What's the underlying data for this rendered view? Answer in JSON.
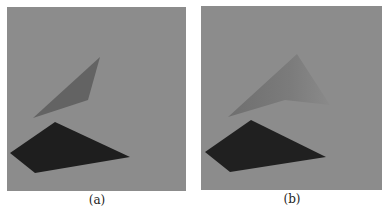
{
  "figure": {
    "panels": [
      {
        "id": "a",
        "caption": "(a)",
        "background": "#8c8c8c",
        "bbox": {
          "x": 7,
          "y": 7,
          "w": 179,
          "h": 184
        },
        "occluder": {
          "color": "#636363",
          "points": "100,57 88,100 33,118"
        },
        "shadow": {
          "color": "#1e1e1e",
          "points": "55,122 10,153 35,173 130,157"
        }
      },
      {
        "id": "b",
        "caption": "(b)",
        "background": "#8c8c8c",
        "bbox": {
          "x": 201,
          "y": 6,
          "w": 181,
          "h": 184
        },
        "occluder": {
          "color": "#7a7a7a",
          "points": "297,54 228,117 285,100 330,105"
        },
        "shadow": {
          "color": "#202020",
          "points": "251,120 205,152 230,172 326,157"
        }
      }
    ]
  }
}
